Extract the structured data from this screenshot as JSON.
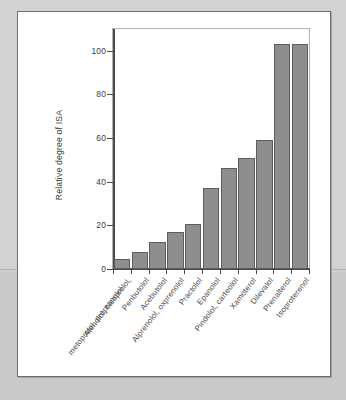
{
  "figure": {
    "panel_name": "figure-panel",
    "background_color": "#ffffff",
    "page_background_color": "#c8c8c8"
  },
  "chart_data": {
    "type": "bar",
    "title": "",
    "xlabel": "",
    "ylabel": "Relative degree of ISA",
    "ylim": [
      0,
      110
    ],
    "yticks": [
      0,
      20,
      40,
      60,
      80,
      100
    ],
    "ytick_labels": [
      "0",
      "20",
      "40",
      "60",
      "80",
      "100"
    ],
    "grid": false,
    "legend": null,
    "bar_color": "#8e8e8e",
    "bar_edge_color": "#5d5d5d",
    "categories": [
      "Atenolol, bisoprolol, metoprolol, propranolol",
      "Penbutolol",
      "Acebutolol",
      "Alprenolol, oxprenolol",
      "Practolol",
      "Epanolol",
      "Pindolol, carteolol",
      "Xamoterol",
      "Dilevalol",
      "Prenalterol",
      "Isoproterenol"
    ],
    "category_lines": [
      [
        "Atenolol, bisoprolol,",
        "metoprolol, propranolol"
      ],
      [
        "Penbutolol",
        ""
      ],
      [
        "Acebutolol",
        ""
      ],
      [
        "Alprenolol, oxprenolol",
        ""
      ],
      [
        "Practolol",
        ""
      ],
      [
        "Epanolol",
        ""
      ],
      [
        "Pindolol, carteolol",
        ""
      ],
      [
        "Xamoterol",
        ""
      ],
      [
        "Dilevalol",
        ""
      ],
      [
        "Prenalterol",
        ""
      ],
      [
        "Isoproterenol",
        ""
      ]
    ],
    "values": [
      4.5,
      8,
      12.5,
      17,
      20.5,
      37,
      46.5,
      51,
      59,
      103,
      103
    ],
    "bars": [
      {
        "label": "Atenolol, bisoprolol, metoprolol, propranolol",
        "value": 4.5
      },
      {
        "label": "Penbutolol",
        "value": 8
      },
      {
        "label": "Acebutolol",
        "value": 12.5
      },
      {
        "label": "Alprenolol, oxprenolol",
        "value": 17
      },
      {
        "label": "Practolol",
        "value": 20.5
      },
      {
        "label": "Epanolol",
        "value": 37
      },
      {
        "label": "Pindolol, carteolol",
        "value": 46.5
      },
      {
        "label": "Xamoterol",
        "value": 51
      },
      {
        "label": "Dilevalol",
        "value": 59
      },
      {
        "label": "Prenalterol",
        "value": 103
      },
      {
        "label": "Isoproterenol",
        "value": 103
      }
    ]
  }
}
